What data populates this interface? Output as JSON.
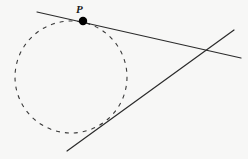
{
  "figure": {
    "canvas": {
      "width": 248,
      "height": 159
    },
    "background_color": "#f7f7f6",
    "ink_color": "#2b2b2b",
    "point_color": "#000000"
  },
  "labels": [
    {
      "id": "point-p",
      "text": "P",
      "x": 76,
      "y": 4,
      "font_size": 11,
      "style": "italic-bold-serif"
    }
  ],
  "geometry": {
    "circle": {
      "name": "dashed-circle",
      "cx": 71,
      "cy": 77,
      "r": 56,
      "stroke": "#3a3a3a",
      "stroke_width": 1.1,
      "dash_pattern": "4 5",
      "fill": "none"
    },
    "lines": [
      {
        "name": "tangent-line-upper",
        "x1": 37,
        "y1": 12,
        "x2": 241,
        "y2": 58,
        "stroke": "#2b2b2b",
        "stroke_width": 1.2
      },
      {
        "name": "tangent-line-lower",
        "x1": 67,
        "y1": 151,
        "x2": 234,
        "y2": 30,
        "stroke": "#2b2b2b",
        "stroke_width": 1.2
      }
    ],
    "points": [
      {
        "name": "tangency-point-p",
        "cx": 83,
        "cy": 21,
        "r": 4.2,
        "fill": "#000000"
      }
    ],
    "intersection": {
      "name": "lines-intersection",
      "cx": 208,
      "cy": 52
    }
  },
  "chart_data": {
    "type": "diagram",
    "elements": [
      {
        "kind": "circle",
        "label": "",
        "center": [
          71,
          77
        ],
        "radius": 56,
        "style": "dashed"
      },
      {
        "kind": "line",
        "label": "tangent through P",
        "from": [
          37,
          12
        ],
        "to": [
          241,
          58
        ],
        "style": "solid"
      },
      {
        "kind": "line",
        "label": "second tangent",
        "from": [
          67,
          151
        ],
        "to": [
          234,
          30
        ],
        "style": "solid"
      },
      {
        "kind": "point",
        "label": "P",
        "at": [
          83,
          21
        ],
        "style": "filled"
      }
    ]
  }
}
